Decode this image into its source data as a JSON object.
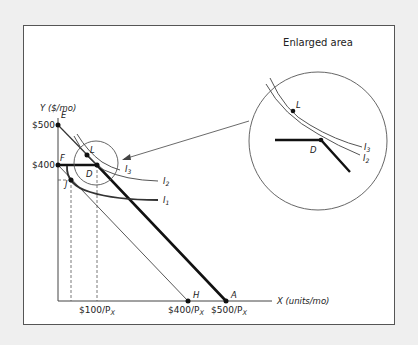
{
  "diagram": {
    "title": "Enlarged area",
    "y_axis_label": "Y ($/mo)",
    "x_axis_label": "X (units/mo)",
    "y_ticks": [
      {
        "label": "$500",
        "point": "E"
      },
      {
        "label": "$400",
        "point": "F"
      }
    ],
    "x_ticks": [
      {
        "label": "$100/P",
        "sub": "X"
      },
      {
        "label": "$400/P",
        "sub": "X",
        "point": "H"
      },
      {
        "label": "$500/P",
        "sub": "X",
        "point": "A"
      }
    ],
    "points": {
      "E": "E",
      "F": "F",
      "J": "J",
      "L": "L",
      "D": "D",
      "H": "H",
      "A": "A"
    },
    "curves": {
      "I1": {
        "base": "I",
        "sub": "1"
      },
      "I2": {
        "base": "I",
        "sub": "2"
      },
      "I3": {
        "base": "I",
        "sub": "3"
      }
    },
    "enlarged": {
      "L": "L",
      "D": "D",
      "I3": {
        "base": "I",
        "sub": "3"
      },
      "I2": {
        "base": "I",
        "sub": "2"
      }
    },
    "colors": {
      "background": "#efefef",
      "panel": "#ffffff",
      "budget_line": "#111111",
      "curve": "#555555"
    }
  }
}
